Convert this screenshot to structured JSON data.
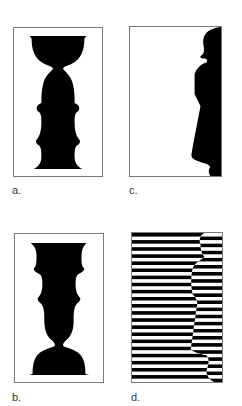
{
  "figure": {
    "panels": [
      {
        "id": "a",
        "label": "a.",
        "description": "Rubin vase silhouette (vase with bowl top)"
      },
      {
        "id": "b",
        "label": "b.",
        "description": "Inverted vase/face-profile silhouette"
      },
      {
        "id": "c",
        "label": "c.",
        "description": "Figure silhouette at right edge (figure-ground)"
      },
      {
        "id": "d",
        "label": "d.",
        "description": "Horizontal stripe pattern with offset profile contour"
      }
    ],
    "colors": {
      "ink": "#000000",
      "paper": "#ffffff",
      "frame": "#7a7a7a"
    },
    "stripes": {
      "count": 21
    }
  }
}
